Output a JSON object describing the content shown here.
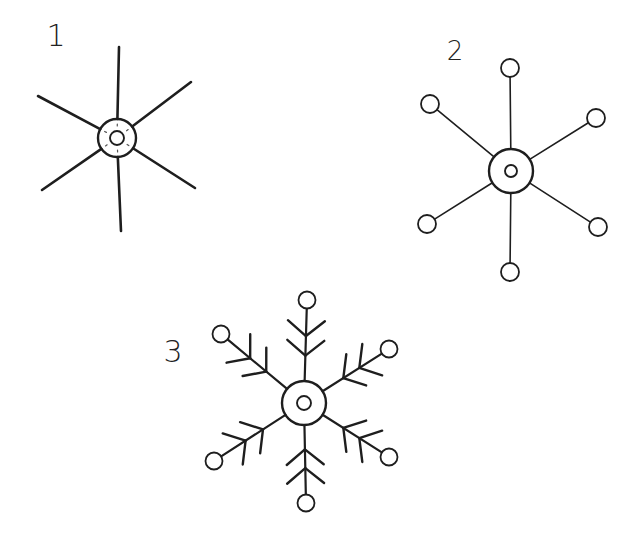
{
  "figure": {
    "background": "#ffffff",
    "ink_color": "#1e1e1e",
    "width": 617,
    "height": 545
  },
  "steps": [
    {
      "label": "1",
      "label_pos": [
        56,
        46
      ],
      "center": [
        117,
        138
      ],
      "outer_radius": 19,
      "inner_radius": 7,
      "arm_ends": [
        [
          119,
          47
        ],
        [
          191,
          82
        ],
        [
          195,
          188
        ],
        [
          121,
          231
        ],
        [
          42,
          190
        ],
        [
          38,
          96
        ]
      ],
      "arm_width": 2.6,
      "end_circles": false,
      "branches": false,
      "ring_ticks": true
    },
    {
      "label": "2",
      "label_pos": [
        455,
        60
      ],
      "center": [
        511,
        171
      ],
      "outer_radius": 22,
      "inner_radius": 6,
      "arm_ends": [
        [
          510,
          68
        ],
        [
          596,
          118
        ],
        [
          598,
          227
        ],
        [
          510,
          272
        ],
        [
          427,
          224
        ],
        [
          430,
          104
        ]
      ],
      "arm_width": 1.6,
      "end_circles": true,
      "end_circle_radius": 9,
      "branches": false,
      "ring_ticks": false
    },
    {
      "label": "3",
      "label_pos": [
        173,
        362
      ],
      "center": [
        304,
        403
      ],
      "outer_radius": 22,
      "inner_radius": 7,
      "arm_ends": [
        [
          307,
          300
        ],
        [
          389,
          349
        ],
        [
          389,
          457
        ],
        [
          306,
          503
        ],
        [
          214,
          461
        ],
        [
          221,
          334
        ]
      ],
      "arm_width": 2.2,
      "end_circles": true,
      "end_circle_radius": 8.5,
      "branches": true,
      "branch_positions": [
        0.35,
        0.62
      ],
      "branch_length": 24,
      "ring_ticks": false
    }
  ],
  "baseline": {
    "y": 524,
    "x1": 0,
    "x2": 617
  }
}
